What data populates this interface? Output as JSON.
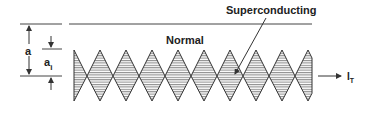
{
  "figure": {
    "labels": {
      "superconducting": "Superconducting",
      "normal": "Normal",
      "a": "a",
      "a_i_main": "a",
      "a_i_sub": "i",
      "current_main": "I",
      "current_sub": "T"
    },
    "diamond_count": 9,
    "colors": {
      "line": "#333333",
      "hatch": "#555555",
      "background": "#ffffff"
    }
  }
}
